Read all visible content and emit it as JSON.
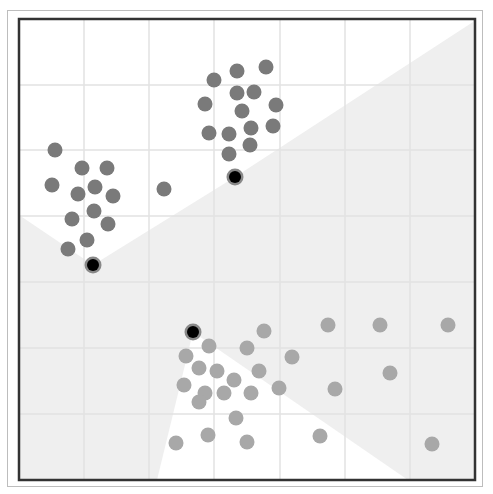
{
  "chart_data": {
    "type": "scatter",
    "title": "",
    "subtitle": "k-means clustering (Voronoi partition with centroids)",
    "xlabel": "",
    "ylabel": "",
    "grid": true,
    "legend": null,
    "plot_box_px": {
      "x0": 19,
      "y0": 19,
      "x1": 475,
      "y1": 480
    },
    "grid_lines_px": {
      "vertical": [
        84,
        149,
        214,
        280,
        345,
        410
      ],
      "horizontal": [
        85,
        150,
        216,
        282,
        348,
        414
      ]
    },
    "colors": {
      "cluster_a_points": "#7a7a7a",
      "cluster_b_points": "#a8a8a8",
      "centroid_fill": "#000000",
      "centroid_ring": "#888888",
      "region_shaded": "#efefef",
      "region_white": "#ffffff",
      "grid": "#e2e2e2",
      "border": "#333333"
    },
    "regions": [
      {
        "name": "top-white-region",
        "fill": "#ffffff",
        "points": [
          [
            19,
            19
          ],
          [
            473,
            19
          ],
          [
            473,
            22
          ],
          [
            235,
            177
          ],
          [
            93,
            265
          ],
          [
            19,
            215
          ]
        ]
      },
      {
        "name": "bottom-white-region",
        "fill": "#ffffff",
        "points": [
          [
            193,
            332
          ],
          [
            408,
            480
          ],
          [
            157,
            480
          ]
        ]
      }
    ],
    "series": [
      {
        "name": "cluster-top",
        "color": "#7a7a7a",
        "points": [
          [
            214,
            80
          ],
          [
            237,
            71
          ],
          [
            266,
            67
          ],
          [
            205,
            104
          ],
          [
            237,
            93
          ],
          [
            254,
            92
          ],
          [
            242,
            111
          ],
          [
            276,
            105
          ],
          [
            209,
            133
          ],
          [
            229,
            134
          ],
          [
            251,
            128
          ],
          [
            273,
            126
          ],
          [
            229,
            154
          ],
          [
            250,
            145
          ]
        ]
      },
      {
        "name": "cluster-left",
        "color": "#7a7a7a",
        "points": [
          [
            55,
            150
          ],
          [
            82,
            168
          ],
          [
            107,
            168
          ],
          [
            52,
            185
          ],
          [
            78,
            194
          ],
          [
            95,
            187
          ],
          [
            113,
            196
          ],
          [
            94,
            211
          ],
          [
            72,
            219
          ],
          [
            108,
            224
          ],
          [
            87,
            240
          ],
          [
            68,
            249
          ],
          [
            164,
            189
          ]
        ]
      },
      {
        "name": "cluster-bottom",
        "color": "#a8a8a8",
        "points": [
          [
            209,
            346
          ],
          [
            186,
            356
          ],
          [
            264,
            331
          ],
          [
            247,
            348
          ],
          [
            292,
            357
          ],
          [
            199,
            368
          ],
          [
            217,
            371
          ],
          [
            234,
            380
          ],
          [
            259,
            371
          ],
          [
            184,
            385
          ],
          [
            205,
            393
          ],
          [
            224,
            393
          ],
          [
            251,
            393
          ],
          [
            279,
            388
          ],
          [
            199,
            402
          ],
          [
            236,
            418
          ],
          [
            176,
            443
          ],
          [
            208,
            435
          ],
          [
            247,
            442
          ],
          [
            328,
            325
          ],
          [
            380,
            325
          ],
          [
            448,
            325
          ],
          [
            335,
            389
          ],
          [
            390,
            373
          ],
          [
            320,
            436
          ],
          [
            432,
            444
          ]
        ]
      }
    ],
    "centroids": [
      {
        "name": "centroid-top",
        "x": 235,
        "y": 177
      },
      {
        "name": "centroid-left",
        "x": 93,
        "y": 265
      },
      {
        "name": "centroid-bottom",
        "x": 193,
        "y": 332
      }
    ],
    "point_radius_px": 7.5,
    "centroid_radius_px": 7
  }
}
